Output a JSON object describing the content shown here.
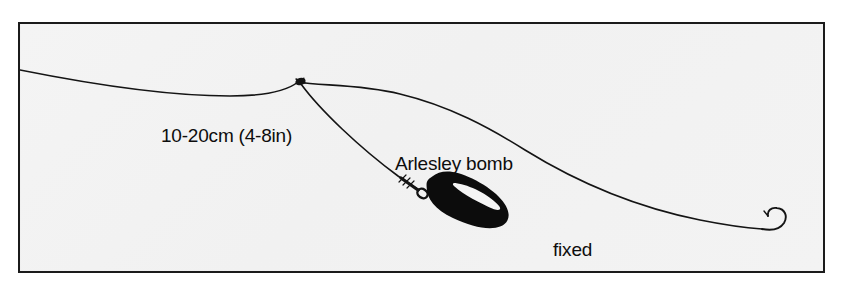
{
  "figure": {
    "kind": "fishing-rig-line-diagram",
    "subject": "fixed paternoster",
    "background_color": "#f2f2f2",
    "page_color": "#ffffff",
    "ink_color": "#141414",
    "frame_color": "#1b1b1b"
  },
  "labels": {
    "dropper_length": "10-20cm (4-8in)",
    "bomb": "Arlesley bomb",
    "rig_name_line1": "fixed",
    "rig_name_line2": "paternoster"
  },
  "components": {
    "mainline_name": "main line",
    "dropper_name": "dropper link",
    "knot_name": "paternoster knot",
    "swivel_name": "link swivel",
    "bomb_name": "Arlesley bomb lead weight",
    "hook_name": "hook"
  }
}
